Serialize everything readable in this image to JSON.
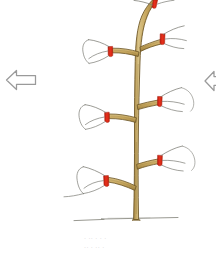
{
  "figure": {
    "background_color": "#ffffff"
  },
  "palette": {
    "trunk_fill": "#c8a85f",
    "trunk_fill_light": "#d8c183",
    "trunk_fill_dark": "#a8873f",
    "trunk_outline": "#6b5424",
    "twig_stroke": "#7a7a72",
    "cut_mark": "#e8301c",
    "cut_mark_dark": "#b81e10",
    "ground_line": "#8d8d85",
    "arrow_outline": "#9a9a9a",
    "caption_text": "#c8c8c8"
  },
  "navigation": {
    "prev": {
      "icon": "arrow-left-icon",
      "label": "Previous",
      "visible": true
    },
    "next": {
      "icon": "arrow-right-icon",
      "label": "Next",
      "clipped": true,
      "visible": true
    }
  },
  "tree": {
    "trunk": {
      "name": "main-leader",
      "description": "Vertical central leader, tan bark, curving to the right at the top"
    },
    "ground": {
      "name": "ground-line",
      "description": "Thin horizontal soil line at the base of the trunk"
    },
    "branches": [
      {
        "id": 1,
        "side": "top",
        "label": "Leader tip cut",
        "cut_mark": true,
        "clipped_top": true
      },
      {
        "id": 2,
        "side": "right",
        "label": "Upper right scaffold",
        "cut_mark": true,
        "twigs": 3
      },
      {
        "id": 3,
        "side": "left",
        "label": "Upper left scaffold",
        "cut_mark": true,
        "twigs": 3
      },
      {
        "id": 4,
        "side": "right",
        "label": "Middle right scaffold",
        "cut_mark": true,
        "twigs": 3
      },
      {
        "id": 5,
        "side": "left",
        "label": "Middle left scaffold",
        "cut_mark": true,
        "twigs": 3
      },
      {
        "id": 6,
        "side": "right",
        "label": "Lower right scaffold",
        "cut_mark": true,
        "twigs": 3
      },
      {
        "id": 7,
        "side": "left",
        "label": "Lower left scaffold",
        "cut_mark": true,
        "twigs": 3
      }
    ],
    "cut_mark_legend": "Red bars indicate the pruning cut position on each branch"
  },
  "caption": {
    "line1": "·  ·· ·  · ·",
    "line2": "·· ·  ·· ·"
  }
}
